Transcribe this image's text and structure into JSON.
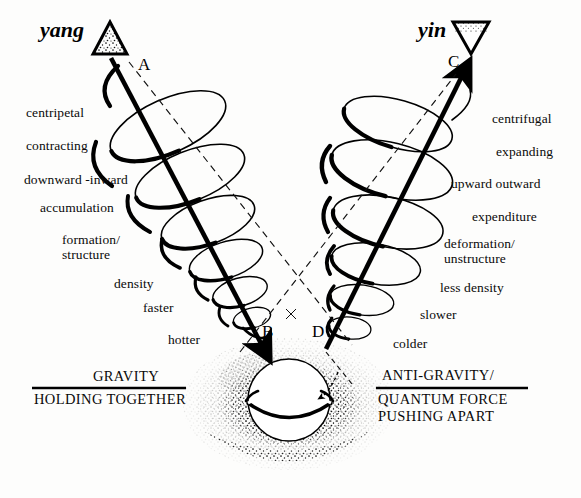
{
  "diagram": {
    "title_left_pole": "yang",
    "title_right_pole": "yin",
    "nodes": {
      "a": "A",
      "b": "B",
      "c": "C",
      "d": "D"
    },
    "left_labels": [
      "centripetal",
      "contracting",
      "downward -inward",
      "accumulation",
      "formation/\nstructure",
      "density",
      "faster",
      "hotter"
    ],
    "right_labels": [
      "centrifugal",
      "expanding",
      "upward  outward",
      "expenditure",
      "deformation/\nunstructure",
      "less density",
      "slower",
      "colder"
    ],
    "force_left": {
      "above_rule": "GRAVITY",
      "below_rule": "HOLDING TOGETHER"
    },
    "force_right": {
      "above_rule": "ANTI-GRAVITY/",
      "below_rule": "QUANTUM FORCE\nPUSHING APART"
    },
    "icons": {
      "yang_symbol": "up-triangle-icon",
      "yin_symbol": "down-triangle-icon",
      "left_arrow": "arrow-down-into-sphere-icon",
      "right_arrow": "arrow-up-out-of-sphere-icon",
      "sphere": "sphere-with-ring-icon",
      "halo": "stippled-halo-icon",
      "left_helix": "contracting-helix-icon",
      "right_helix": "expanding-helix-icon",
      "dashed_axes": "dashed-crossing-axes-icon"
    },
    "colors": {
      "ink": "#000000",
      "background": "#fdfdfc",
      "stipple": "#1a1a1a"
    }
  }
}
